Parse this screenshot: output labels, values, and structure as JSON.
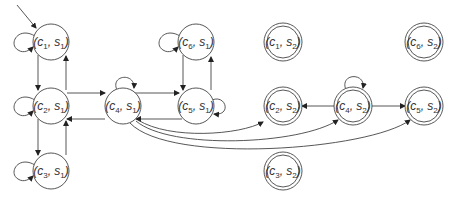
{
  "diagram": {
    "type": "state-transition-graph",
    "colors": {
      "stroke": "#444444",
      "background": "#ffffff",
      "text": "#333333"
    },
    "initial_state": "c1s1",
    "nodes": [
      {
        "id": "c1s1",
        "c": "c",
        "ci": "1",
        "s": "s",
        "si": "1",
        "x": 51,
        "y": 42,
        "accepting": false
      },
      {
        "id": "c2s1",
        "c": "c",
        "ci": "2",
        "s": "s",
        "si": "1",
        "x": 51,
        "y": 106,
        "accepting": false
      },
      {
        "id": "c3s1",
        "c": "c",
        "ci": "3",
        "s": "s",
        "si": "1",
        "x": 51,
        "y": 171,
        "accepting": false
      },
      {
        "id": "c4s1",
        "c": "c",
        "ci": "4",
        "s": "s",
        "si": "1",
        "x": 123,
        "y": 106,
        "accepting": false
      },
      {
        "id": "c5s1",
        "c": "c",
        "ci": "5",
        "s": "s",
        "si": "1",
        "x": 196,
        "y": 106,
        "accepting": false
      },
      {
        "id": "c6s1",
        "c": "c",
        "ci": "6",
        "s": "s",
        "si": "1",
        "x": 196,
        "y": 42,
        "accepting": false
      },
      {
        "id": "c1s2",
        "c": "c",
        "ci": "1",
        "s": "s",
        "si": "2",
        "x": 283,
        "y": 42,
        "accepting": true
      },
      {
        "id": "c6s2",
        "c": "c",
        "ci": "6",
        "s": "s",
        "si": "2",
        "x": 424,
        "y": 42,
        "accepting": true
      },
      {
        "id": "c2s2",
        "c": "c",
        "ci": "2",
        "s": "s",
        "si": "2",
        "x": 283,
        "y": 106,
        "accepting": true
      },
      {
        "id": "c4s2",
        "c": "c",
        "ci": "4",
        "s": "s",
        "si": "2",
        "x": 353,
        "y": 106,
        "accepting": true
      },
      {
        "id": "c5s2",
        "c": "c",
        "ci": "5",
        "s": "s",
        "si": "2",
        "x": 424,
        "y": 106,
        "accepting": true
      },
      {
        "id": "c3s2",
        "c": "c",
        "ci": "3",
        "s": "s",
        "si": "2",
        "x": 283,
        "y": 171,
        "accepting": true
      }
    ],
    "edges": [
      {
        "from": "c1s1",
        "to": "c1s1",
        "kind": "self-loop"
      },
      {
        "from": "c1s1",
        "to": "c2s1"
      },
      {
        "from": "c2s1",
        "to": "c1s1"
      },
      {
        "from": "c2s1",
        "to": "c2s1",
        "kind": "self-loop"
      },
      {
        "from": "c2s1",
        "to": "c3s1"
      },
      {
        "from": "c3s1",
        "to": "c2s1"
      },
      {
        "from": "c3s1",
        "to": "c3s1",
        "kind": "self-loop"
      },
      {
        "from": "c2s1",
        "to": "c4s1"
      },
      {
        "from": "c4s1",
        "to": "c2s1"
      },
      {
        "from": "c4s1",
        "to": "c4s1",
        "kind": "self-loop"
      },
      {
        "from": "c4s1",
        "to": "c5s1"
      },
      {
        "from": "c5s1",
        "to": "c4s1"
      },
      {
        "from": "c5s1",
        "to": "c5s1",
        "kind": "self-loop"
      },
      {
        "from": "c6s1",
        "to": "c5s1"
      },
      {
        "from": "c5s1",
        "to": "c6s1"
      },
      {
        "from": "c6s1",
        "to": "c6s1",
        "kind": "self-loop"
      },
      {
        "from": "c4s1",
        "to": "c2s2",
        "kind": "curved"
      },
      {
        "from": "c4s1",
        "to": "c4s2",
        "kind": "curved"
      },
      {
        "from": "c4s1",
        "to": "c5s2",
        "kind": "curved"
      },
      {
        "from": "c4s2",
        "to": "c4s2",
        "kind": "self-loop"
      },
      {
        "from": "c4s2",
        "to": "c2s2"
      },
      {
        "from": "c4s2",
        "to": "c5s2"
      }
    ]
  }
}
